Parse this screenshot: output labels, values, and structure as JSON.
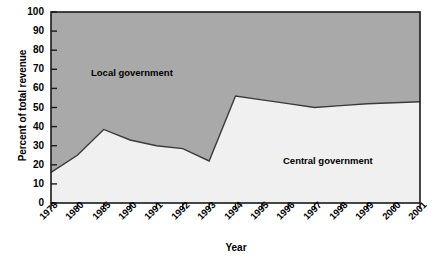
{
  "chart_data": {
    "type": "area",
    "title": "",
    "xlabel": "Year",
    "ylabel": "Percent of total revenue",
    "categories": [
      "1978",
      "1980",
      "1985",
      "1990",
      "1991",
      "1992",
      "1993",
      "1994",
      "1995",
      "1996",
      "1997",
      "1998",
      "1999",
      "2000",
      "2001"
    ],
    "ylim": [
      0,
      100
    ],
    "xlim_labels": [
      "1978",
      "2001"
    ],
    "ytick_labels": [
      "0",
      "10",
      "20",
      "30",
      "40",
      "50",
      "60",
      "70",
      "80",
      "90",
      "100"
    ],
    "yticks": [
      0,
      10,
      20,
      30,
      40,
      50,
      60,
      70,
      80,
      90,
      100
    ],
    "grid": false,
    "legend_position": "inline-annotations",
    "stacked": true,
    "series": [
      {
        "name": "Central government",
        "label_text": "Central government",
        "fill_color": "#f0f0f0",
        "values": [
          16,
          25,
          38.5,
          33,
          30,
          28.5,
          22,
          56,
          54,
          52,
          50,
          51,
          52,
          52.5,
          53
        ]
      },
      {
        "name": "Local government",
        "label_text": "Local government",
        "fill_color": "#a9a9a9",
        "values": [
          84,
          75,
          61.5,
          67,
          70,
          71.5,
          78,
          44,
          46,
          48,
          50,
          49,
          48,
          47.5,
          47
        ]
      }
    ],
    "annotations": [
      {
        "text": "Local government",
        "x_category": "1985",
        "y_value": 70
      },
      {
        "text": "Central government",
        "x_category": "1997",
        "y_value": 27
      }
    ],
    "colors": {
      "axis": "#000000",
      "line": "#3a3a3a",
      "local_government_fill": "#a9a9a9",
      "central_government_fill": "#f0f0f0",
      "background": "#ffffff"
    }
  }
}
